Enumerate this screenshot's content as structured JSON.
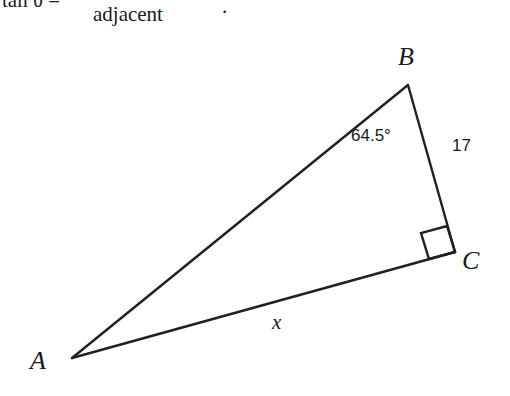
{
  "figure": {
    "type": "right-triangle-diagram",
    "background_color": "#ffffff",
    "stroke_color": "#231f20",
    "formula": {
      "lhs": "tan θ =",
      "denominator": "adjacent",
      "period": "."
    },
    "vertices": {
      "A": "A",
      "B": "B",
      "C": "C"
    },
    "labels": {
      "angle_at_B": "64.5°",
      "side_BC": "17",
      "side_AC": "x"
    },
    "geometry": {
      "A": [
        72,
        358
      ],
      "B": [
        408,
        85
      ],
      "C": [
        455,
        252
      ],
      "right_angle_at": "C"
    }
  }
}
